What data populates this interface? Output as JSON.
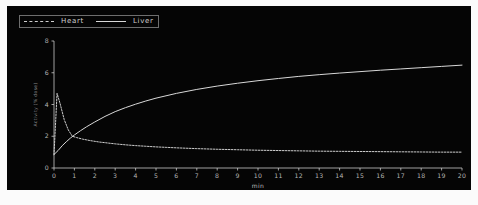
{
  "figure": {
    "background_color": "#050505",
    "page_color": "#fbfbfb",
    "foreground_color": "#d8d8d8"
  },
  "legend": {
    "position": "top-left",
    "entries": [
      {
        "label": "Heart",
        "style": "dashed",
        "color": "#cfcfcf",
        "icon": "line-dashed-icon"
      },
      {
        "label": "Liver",
        "style": "solid",
        "color": "#d8d8d8",
        "icon": "line-solid-icon"
      }
    ]
  },
  "chart_data": {
    "type": "line",
    "title": "",
    "xlabel": "min",
    "ylabel": "Activity (% dose)",
    "xlim": [
      0,
      20
    ],
    "ylim": [
      0,
      8
    ],
    "xticks": [
      0,
      1,
      2,
      3,
      4,
      5,
      6,
      7,
      8,
      9,
      10,
      11,
      12,
      13,
      14,
      15,
      16,
      17,
      18,
      19,
      20
    ],
    "yticks": [
      0,
      2,
      4,
      6,
      8
    ],
    "xtick_labels": [
      "0",
      "1",
      "2",
      "3",
      "4",
      "5",
      "6",
      "7",
      "8",
      "9",
      "10",
      "11",
      "12",
      "13",
      "14",
      "15",
      "16",
      "17",
      "18",
      "19",
      "20"
    ],
    "ytick_labels": [
      "0",
      "2",
      "4",
      "6",
      "8"
    ],
    "grid": false,
    "legend_position": "top-left",
    "series": [
      {
        "name": "Heart",
        "style": "dashed",
        "color": "#cfcfcf",
        "x": [
          0.0,
          0.15,
          0.3,
          0.5,
          0.7,
          0.9,
          1.1,
          1.4,
          1.8,
          2.2,
          2.6,
          3.0,
          3.5,
          4.0,
          4.5,
          5.0,
          5.5,
          6.0,
          7.0,
          8.0,
          9.0,
          10.0,
          11.0,
          12.0,
          13.0,
          14.0,
          15.0,
          16.0,
          17.0,
          18.0,
          19.0,
          20.0
        ],
        "y": [
          0.85,
          4.7,
          4.05,
          3.05,
          2.4,
          2.0,
          1.92,
          1.82,
          1.72,
          1.64,
          1.58,
          1.52,
          1.46,
          1.41,
          1.37,
          1.33,
          1.3,
          1.27,
          1.22,
          1.18,
          1.15,
          1.12,
          1.1,
          1.08,
          1.06,
          1.05,
          1.04,
          1.03,
          1.02,
          1.01,
          1.0,
          1.0
        ]
      },
      {
        "name": "Liver",
        "style": "solid",
        "color": "#d8d8d8",
        "x": [
          0.0,
          0.2,
          0.4,
          0.6,
          0.8,
          1.0,
          1.3,
          1.6,
          2.0,
          2.5,
          3.0,
          3.5,
          4.0,
          4.5,
          5.0,
          6.0,
          7.0,
          8.0,
          9.0,
          10.0,
          11.0,
          12.0,
          13.0,
          14.0,
          15.0,
          16.0,
          17.0,
          18.0,
          19.0,
          20.0
        ],
        "y": [
          0.85,
          1.1,
          1.4,
          1.65,
          1.88,
          2.08,
          2.35,
          2.6,
          2.9,
          3.25,
          3.55,
          3.8,
          4.02,
          4.22,
          4.4,
          4.7,
          4.95,
          5.16,
          5.34,
          5.5,
          5.64,
          5.77,
          5.88,
          5.98,
          6.07,
          6.16,
          6.24,
          6.32,
          6.4,
          6.48
        ]
      }
    ]
  }
}
